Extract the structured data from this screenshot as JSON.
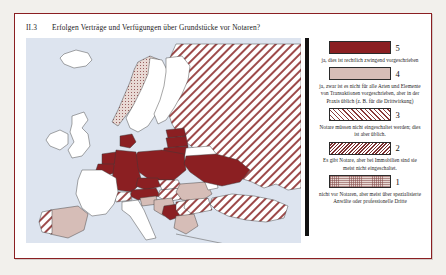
{
  "figure": {
    "number": "II.3",
    "title": "Erfolgen Verträge und Verfügungen über Grundstücke vor Notaren?"
  },
  "map": {
    "background_color": "#dde4ef",
    "jp_marker_label": "JP",
    "jp_marker_category": 2,
    "countries": [
      {
        "code": "IS",
        "name": "Island",
        "category": 0
      },
      {
        "code": "NO",
        "name": "Norwegen",
        "category": 1
      },
      {
        "code": "SE",
        "name": "Schweden",
        "category": 0
      },
      {
        "code": "FI",
        "name": "Finnland",
        "category": 0
      },
      {
        "code": "IE",
        "name": "Irland",
        "category": 0
      },
      {
        "code": "GB",
        "name": "Vereinigtes Königreich",
        "category": 0
      },
      {
        "code": "NL",
        "name": "Niederlande",
        "category": 5
      },
      {
        "code": "BE",
        "name": "Belgien",
        "category": 5
      },
      {
        "code": "DE",
        "name": "Deutschland",
        "category": 5
      },
      {
        "code": "AT",
        "name": "Österreich",
        "category": 5
      },
      {
        "code": "FR",
        "name": "Frankreich",
        "category": 0
      },
      {
        "code": "IT",
        "name": "Italien",
        "category": 0
      },
      {
        "code": "ES",
        "name": "Spanien",
        "category": 4
      },
      {
        "code": "PT",
        "name": "Portugal",
        "category": 3
      },
      {
        "code": "CH",
        "name": "Schweiz",
        "category": 3
      },
      {
        "code": "CZ",
        "name": "Tschechien",
        "category": 5
      },
      {
        "code": "SK",
        "name": "Slowakei",
        "category": 3
      },
      {
        "code": "PL",
        "name": "Polen",
        "category": 5
      },
      {
        "code": "HU",
        "name": "Ungarn",
        "category": 3
      },
      {
        "code": "SI",
        "name": "Slowenien",
        "category": 4
      },
      {
        "code": "HR",
        "name": "Kroatien",
        "category": 4
      },
      {
        "code": "BA",
        "name": "Bosnien und Herzegowina",
        "category": 5
      },
      {
        "code": "RS",
        "name": "Serbien",
        "category": 3
      },
      {
        "code": "RO",
        "name": "Rumänien",
        "category": 4
      },
      {
        "code": "BG",
        "name": "Bulgarien",
        "category": 3
      },
      {
        "code": "GR",
        "name": "Griechenland",
        "category": 4
      },
      {
        "code": "EE",
        "name": "Estland",
        "category": 5
      },
      {
        "code": "LV",
        "name": "Lettland",
        "category": 5
      },
      {
        "code": "LT",
        "name": "Litauen",
        "category": 5
      },
      {
        "code": "BY",
        "name": "Belarus",
        "category": 0
      },
      {
        "code": "UA",
        "name": "Ukraine",
        "category": 5
      },
      {
        "code": "MD",
        "name": "Moldau",
        "category": 0
      },
      {
        "code": "RU",
        "name": "Russland",
        "category": 3
      },
      {
        "code": "TR",
        "name": "Türkei",
        "category": 3
      },
      {
        "code": "DK",
        "name": "Dänemark",
        "category": 5
      }
    ]
  },
  "legend": {
    "items": [
      {
        "number": "5",
        "pattern": "solid-dark-red",
        "color": "#8b1f22",
        "description": "ja, dies ist rechtlich zwingend vorgeschrieben"
      },
      {
        "number": "4",
        "pattern": "solid-light-pink",
        "color": "#d6bdb7",
        "description": "ja, zwar ist es nicht für alle Arten und Elemente von Transaktionen vorgeschrieben, aber in der Praxis üblich (z. B. für die Drittwirkung)"
      },
      {
        "number": "3",
        "pattern": "wide-diagonal-hatch",
        "color": "#8b3a3a",
        "description": "Notare müssen nicht eingeschaltet werden; dies ist aber üblich."
      },
      {
        "number": "2",
        "pattern": "dense-diagonal-hatch",
        "color": "#7d3030",
        "description": "Es gibt Notare, aber bei Immobilien sind sie meist nicht eingeschaltet."
      },
      {
        "number": "1",
        "pattern": "fine-dotted-grid",
        "color": "#e8d9d4",
        "description": "nicht vor Notaren, aber meist über spezialisierte Anwälte oder professionelle Dritte"
      }
    ]
  }
}
